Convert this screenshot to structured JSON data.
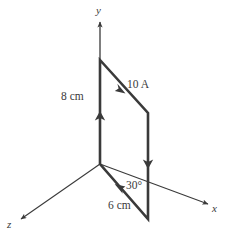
{
  "figure": {
    "background_color": "#ffffff",
    "line_color": "#3a3a3a",
    "axes": {
      "origin": {
        "x": 100,
        "y": 164
      },
      "items": [
        {
          "name": "y-axis",
          "label": "y",
          "direction": "up",
          "tip": {
            "x": 100,
            "y": 20
          }
        },
        {
          "name": "x-axis",
          "label": "x",
          "direction": "right-down",
          "tip": {
            "x": 210,
            "y": 205
          }
        },
        {
          "name": "z-axis",
          "label": "z",
          "direction": "left-down",
          "tip": {
            "x": 19,
            "y": 220
          }
        }
      ]
    },
    "loop": {
      "name": "current-loop",
      "shape": "parallelogram",
      "vertices": [
        {
          "name": "top-left",
          "x": 100,
          "y": 60
        },
        {
          "name": "top-right",
          "x": 148,
          "y": 113
        },
        {
          "name": "bottom-right",
          "x": 148,
          "y": 219
        },
        {
          "name": "origin-corner",
          "x": 100,
          "y": 164
        }
      ],
      "current_direction": "clockwise-as-drawn",
      "arrows": [
        {
          "name": "left-side-arrow",
          "x": 100,
          "y": 117,
          "points": "up"
        },
        {
          "name": "top-edge-arrow",
          "x": 121,
          "y": 88,
          "points": "down-right"
        },
        {
          "name": "right-side-arrow",
          "x": 148,
          "y": 163,
          "points": "down"
        },
        {
          "name": "bottom-edge-arrow",
          "x": 123,
          "y": 190,
          "points": "up-left"
        }
      ]
    },
    "labels": {
      "y_axis": "y",
      "x_axis": "x",
      "z_axis": "z",
      "left_side_length": "8 cm",
      "bottom_side_length": "6 cm",
      "current": "10 A",
      "angle": "30°"
    }
  }
}
